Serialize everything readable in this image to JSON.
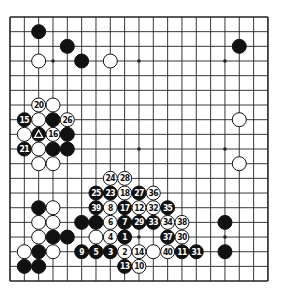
{
  "board": {
    "size": 19,
    "origin": [
      10,
      17
    ],
    "spacing": [
      14.33,
      14.67
    ],
    "stone_radius": 7,
    "hoshi": [
      [
        3,
        3
      ],
      [
        9,
        3
      ],
      [
        15,
        3
      ],
      [
        3,
        9
      ],
      [
        9,
        9
      ],
      [
        15,
        9
      ],
      [
        3,
        15
      ],
      [
        9,
        15
      ],
      [
        15,
        15
      ]
    ],
    "colors": {
      "line": "#222222",
      "black": "#111111",
      "white": "#ffffff",
      "background": "#ffffff"
    }
  },
  "stones": [
    {
      "c": 2,
      "r": 1,
      "color": "black"
    },
    {
      "c": 4,
      "r": 2,
      "color": "black"
    },
    {
      "c": 16,
      "r": 2,
      "color": "black"
    },
    {
      "c": 2,
      "r": 3,
      "color": "white"
    },
    {
      "c": 5,
      "r": 3,
      "color": "black"
    },
    {
      "c": 7,
      "r": 3,
      "color": "white"
    },
    {
      "c": 2,
      "r": 6,
      "color": "white",
      "label": "20"
    },
    {
      "c": 3,
      "r": 6,
      "color": "white"
    },
    {
      "c": 1,
      "r": 7,
      "color": "black",
      "label": "15"
    },
    {
      "c": 2,
      "r": 7,
      "color": "white"
    },
    {
      "c": 3,
      "r": 7,
      "color": "black"
    },
    {
      "c": 4,
      "r": 7,
      "color": "white",
      "label": "26"
    },
    {
      "c": 16,
      "r": 7,
      "color": "white"
    },
    {
      "c": 1,
      "r": 8,
      "color": "white"
    },
    {
      "c": 2,
      "r": 8,
      "color": "black",
      "mark": "triangle"
    },
    {
      "c": 3,
      "r": 8,
      "color": "white",
      "label": "16"
    },
    {
      "c": 4,
      "r": 8,
      "color": "black"
    },
    {
      "c": 1,
      "r": 9,
      "color": "black",
      "label": "21"
    },
    {
      "c": 2,
      "r": 9,
      "color": "white"
    },
    {
      "c": 3,
      "r": 9,
      "color": "black"
    },
    {
      "c": 4,
      "r": 9,
      "color": "black"
    },
    {
      "c": 2,
      "r": 10,
      "color": "white"
    },
    {
      "c": 3,
      "r": 10,
      "color": "white"
    },
    {
      "c": 16,
      "r": 10,
      "color": "white"
    },
    {
      "c": 7,
      "r": 11,
      "color": "white",
      "label": "24"
    },
    {
      "c": 8,
      "r": 11,
      "color": "white",
      "label": "28"
    },
    {
      "c": 6,
      "r": 12,
      "color": "black",
      "label": "25"
    },
    {
      "c": 7,
      "r": 12,
      "color": "black",
      "label": "23"
    },
    {
      "c": 8,
      "r": 12,
      "color": "white",
      "label": "18"
    },
    {
      "c": 9,
      "r": 12,
      "color": "black",
      "label": "27"
    },
    {
      "c": 10,
      "r": 12,
      "color": "white",
      "label": "36"
    },
    {
      "c": 2,
      "r": 13,
      "color": "black"
    },
    {
      "c": 3,
      "r": 13,
      "color": "white"
    },
    {
      "c": 6,
      "r": 13,
      "color": "black",
      "label": "39"
    },
    {
      "c": 7,
      "r": 13,
      "color": "white",
      "label": "8"
    },
    {
      "c": 8,
      "r": 13,
      "color": "black",
      "label": "17"
    },
    {
      "c": 9,
      "r": 13,
      "color": "white",
      "label": "12"
    },
    {
      "c": 10,
      "r": 13,
      "color": "white",
      "label": "32"
    },
    {
      "c": 11,
      "r": 13,
      "color": "black",
      "label": "35"
    },
    {
      "c": 2,
      "r": 14,
      "color": "white"
    },
    {
      "c": 3,
      "r": 14,
      "color": "white"
    },
    {
      "c": 5,
      "r": 14,
      "color": "black"
    },
    {
      "c": 6,
      "r": 14,
      "color": "black"
    },
    {
      "c": 7,
      "r": 14,
      "color": "white",
      "label": "6"
    },
    {
      "c": 8,
      "r": 14,
      "color": "black",
      "label": "7"
    },
    {
      "c": 9,
      "r": 14,
      "color": "black",
      "label": "29"
    },
    {
      "c": 10,
      "r": 14,
      "color": "black",
      "label": "33"
    },
    {
      "c": 11,
      "r": 14,
      "color": "white",
      "label": "34"
    },
    {
      "c": 12,
      "r": 14,
      "color": "white",
      "label": "38"
    },
    {
      "c": 15,
      "r": 14,
      "color": "black"
    },
    {
      "c": 2,
      "r": 15,
      "color": "white"
    },
    {
      "c": 3,
      "r": 15,
      "color": "black"
    },
    {
      "c": 4,
      "r": 15,
      "color": "black"
    },
    {
      "c": 6,
      "r": 15,
      "color": "white"
    },
    {
      "c": 7,
      "r": 15,
      "color": "white",
      "label": "4"
    },
    {
      "c": 8,
      "r": 15,
      "color": "black",
      "label": "1"
    },
    {
      "c": 11,
      "r": 15,
      "color": "black",
      "label": "37"
    },
    {
      "c": 12,
      "r": 15,
      "color": "white",
      "label": "30"
    },
    {
      "c": 1,
      "r": 16,
      "color": "white"
    },
    {
      "c": 2,
      "r": 16,
      "color": "black"
    },
    {
      "c": 3,
      "r": 16,
      "color": "white"
    },
    {
      "c": 5,
      "r": 16,
      "color": "black",
      "label": "9"
    },
    {
      "c": 6,
      "r": 16,
      "color": "black",
      "label": "5"
    },
    {
      "c": 7,
      "r": 16,
      "color": "black",
      "label": "3"
    },
    {
      "c": 8,
      "r": 16,
      "color": "white",
      "label": "2"
    },
    {
      "c": 9,
      "r": 16,
      "color": "white",
      "label": "14"
    },
    {
      "c": 10,
      "r": 16,
      "color": "white"
    },
    {
      "c": 11,
      "r": 16,
      "color": "white",
      "label": "40"
    },
    {
      "c": 12,
      "r": 16,
      "color": "black",
      "label": "11"
    },
    {
      "c": 13,
      "r": 16,
      "color": "black",
      "label": "31"
    },
    {
      "c": 15,
      "r": 16,
      "color": "black"
    },
    {
      "c": 1,
      "r": 17,
      "color": "black"
    },
    {
      "c": 2,
      "r": 17,
      "color": "black"
    },
    {
      "c": 8,
      "r": 17,
      "color": "black",
      "label": "13"
    },
    {
      "c": 9,
      "r": 17,
      "color": "white",
      "label": "10"
    }
  ]
}
